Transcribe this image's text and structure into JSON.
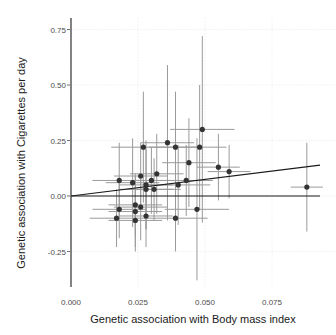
{
  "chart_data": {
    "type": "scatter",
    "title": "",
    "xlabel": "Genetic association with Body mass index",
    "ylabel": "Genetic association with Cigarettes per day",
    "xlim": [
      0.0,
      0.095
    ],
    "ylim": [
      -0.32,
      0.78
    ],
    "x_ticks": [
      "0.000",
      "0.025",
      "0.050",
      "0.075"
    ],
    "x_tick_values": [
      0.0,
      0.025,
      0.05,
      0.075
    ],
    "y_ticks": [
      "-0.25",
      "0.00",
      "0.25",
      "0.50",
      "0.75"
    ],
    "y_tick_values": [
      -0.25,
      0.0,
      0.25,
      0.5,
      0.75
    ],
    "grid": true,
    "legend": null,
    "reference_lines": [
      {
        "type": "hline",
        "y": 0.0,
        "label": "zero line"
      },
      {
        "type": "fit",
        "intercept": 0.0,
        "slope": 1.5,
        "label": "regression line"
      }
    ],
    "points": [
      {
        "x": 0.018,
        "y": 0.07,
        "xerr": 0.01,
        "yerr": 0.17
      },
      {
        "x": 0.023,
        "y": 0.06,
        "xerr": 0.01,
        "yerr": 0.2
      },
      {
        "x": 0.026,
        "y": 0.09,
        "xerr": 0.01,
        "yerr": 0.15
      },
      {
        "x": 0.027,
        "y": 0.22,
        "xerr": 0.012,
        "yerr": 0.25
      },
      {
        "x": 0.028,
        "y": 0.05,
        "xerr": 0.01,
        "yerr": 0.2
      },
      {
        "x": 0.028,
        "y": 0.03,
        "xerr": 0.01,
        "yerr": 0.18
      },
      {
        "x": 0.03,
        "y": 0.07,
        "xerr": 0.008,
        "yerr": 0.15
      },
      {
        "x": 0.031,
        "y": 0.03,
        "xerr": 0.01,
        "yerr": 0.14
      },
      {
        "x": 0.032,
        "y": 0.1,
        "xerr": 0.01,
        "yerr": 0.18
      },
      {
        "x": 0.036,
        "y": 0.24,
        "xerr": 0.01,
        "yerr": 0.35
      },
      {
        "x": 0.039,
        "y": 0.22,
        "xerr": 0.01,
        "yerr": 0.25
      },
      {
        "x": 0.04,
        "y": 0.05,
        "xerr": 0.012,
        "yerr": 0.18
      },
      {
        "x": 0.043,
        "y": 0.07,
        "xerr": 0.01,
        "yerr": 0.16
      },
      {
        "x": 0.044,
        "y": 0.15,
        "xerr": 0.01,
        "yerr": 0.2
      },
      {
        "x": 0.048,
        "y": 0.22,
        "xerr": 0.01,
        "yerr": 0.28
      },
      {
        "x": 0.049,
        "y": 0.3,
        "xerr": 0.012,
        "yerr": 0.42
      },
      {
        "x": 0.055,
        "y": 0.13,
        "xerr": 0.008,
        "yerr": 0.15
      },
      {
        "x": 0.059,
        "y": 0.11,
        "xerr": 0.008,
        "yerr": 0.12
      },
      {
        "x": 0.047,
        "y": -0.06,
        "xerr": 0.012,
        "yerr": 0.32
      },
      {
        "x": 0.018,
        "y": -0.06,
        "xerr": 0.01,
        "yerr": 0.13
      },
      {
        "x": 0.017,
        "y": -0.1,
        "xerr": 0.01,
        "yerr": 0.13
      },
      {
        "x": 0.024,
        "y": -0.04,
        "xerr": 0.01,
        "yerr": 0.14
      },
      {
        "x": 0.024,
        "y": -0.07,
        "xerr": 0.01,
        "yerr": 0.16
      },
      {
        "x": 0.026,
        "y": -0.05,
        "xerr": 0.01,
        "yerr": 0.15
      },
      {
        "x": 0.024,
        "y": -0.11,
        "xerr": 0.01,
        "yerr": 0.14
      },
      {
        "x": 0.028,
        "y": -0.09,
        "xerr": 0.01,
        "yerr": 0.14
      },
      {
        "x": 0.039,
        "y": -0.1,
        "xerr": 0.012,
        "yerr": 0.15
      },
      {
        "x": 0.088,
        "y": 0.04,
        "xerr": 0.006,
        "yerr": 0.2
      }
    ]
  },
  "colors": {
    "point": "#333333",
    "errorbar": "#9a9a9a",
    "line": "#1a1a1a",
    "grid": "#ebebeb",
    "axis": "#333333"
  }
}
